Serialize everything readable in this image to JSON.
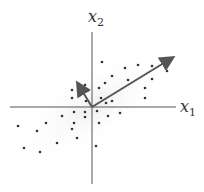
{
  "diagram": {
    "title": "",
    "axes": {
      "x_label": "x",
      "x_sub": "1",
      "y_label": "x",
      "y_sub": "2",
      "origin": [
        92,
        107
      ],
      "x_axis": {
        "x1": 10,
        "x2": 176
      },
      "y_axis": {
        "y1": 32,
        "y2": 184
      }
    },
    "arrows": [
      {
        "name": "principal-component-1",
        "x2": 172,
        "y2": 58
      },
      {
        "name": "principal-component-2",
        "x2": 78,
        "y2": 84
      }
    ],
    "points": [
      [
        102,
        62
      ],
      [
        125,
        68
      ],
      [
        138,
        65
      ],
      [
        152,
        66
      ],
      [
        167,
        71
      ],
      [
        112,
        76
      ],
      [
        128,
        80
      ],
      [
        152,
        79
      ],
      [
        105,
        83
      ],
      [
        145,
        88
      ],
      [
        72,
        90
      ],
      [
        85,
        85
      ],
      [
        99,
        88
      ],
      [
        72,
        98
      ],
      [
        101,
        98
      ],
      [
        112,
        101
      ],
      [
        106,
        103
      ],
      [
        86,
        101
      ],
      [
        145,
        98
      ],
      [
        74,
        112
      ],
      [
        85,
        112
      ],
      [
        97,
        111
      ],
      [
        108,
        116
      ],
      [
        120,
        113
      ],
      [
        62,
        116
      ],
      [
        85,
        117
      ],
      [
        74,
        123
      ],
      [
        99,
        123
      ],
      [
        46,
        123
      ],
      [
        18,
        126
      ],
      [
        37,
        131
      ],
      [
        72,
        129
      ],
      [
        77,
        138
      ],
      [
        57,
        143
      ],
      [
        24,
        148
      ],
      [
        40,
        152
      ],
      [
        96,
        146
      ]
    ],
    "colors": {
      "axis": "#555555",
      "arrow": "#555555",
      "point": "#333333",
      "cloud": "#f0f0f0"
    }
  }
}
